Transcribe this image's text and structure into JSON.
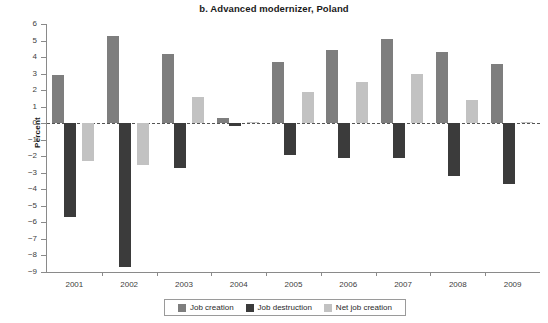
{
  "chart_data": {
    "type": "bar",
    "title": "b. Advanced modernizer, Poland",
    "xlabel": "",
    "ylabel": "Percent",
    "categories": [
      "2001",
      "2002",
      "2003",
      "2004",
      "2005",
      "2006",
      "2007",
      "2008",
      "2009"
    ],
    "series": [
      {
        "name": "Job creation",
        "color": "#7e7e7e",
        "values": [
          2.9,
          5.3,
          4.2,
          0.3,
          3.7,
          4.4,
          5.1,
          4.3,
          3.6
        ]
      },
      {
        "name": "Job destruction",
        "color": "#3b3b3b",
        "values": [
          -5.7,
          -8.7,
          -2.7,
          -0.2,
          -1.9,
          -2.1,
          -2.1,
          -3.2,
          -3.7
        ]
      },
      {
        "name": "Net job creation",
        "color": "#c2c2c2",
        "values": [
          -2.3,
          -2.5,
          1.6,
          0.1,
          1.9,
          2.5,
          3.0,
          1.4,
          0.05
        ]
      }
    ],
    "ylim": [
      -9,
      6
    ],
    "ytick_values": [
      6,
      5,
      4,
      3,
      2,
      1,
      0,
      -1,
      -2,
      -3,
      -4,
      -5,
      -6,
      -7,
      -8,
      -9
    ],
    "ytick_labels": [
      "6",
      "5",
      "4",
      "3",
      "2",
      "1",
      "0",
      "−1",
      "−2",
      "−3",
      "−4",
      "−5",
      "−6",
      "−7",
      "−8",
      "−9"
    ],
    "grid": false,
    "zero_line": "dashed",
    "legend_position": "bottom-center",
    "legend_entries": [
      "Job creation",
      "Job destruction",
      "Net job creation"
    ]
  }
}
